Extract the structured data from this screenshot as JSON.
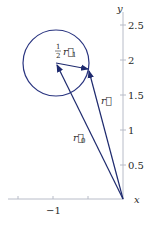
{
  "figure": {
    "colors": {
      "axis": "#b8bcc8",
      "vector": "#1e2a6e",
      "circle": "#2a3580",
      "text": "#2a2a2a"
    },
    "axes": {
      "x_label": "x",
      "y_label": "y",
      "x_ticks": [
        {
          "value": -1.5,
          "label": ""
        },
        {
          "value": -1,
          "label": "−1"
        },
        {
          "value": -0.5,
          "label": ""
        }
      ],
      "y_ticks": [
        {
          "value": 0.5,
          "label": "0.5"
        },
        {
          "value": 1,
          "label": "1"
        },
        {
          "value": 1.5,
          "label": "1.5"
        },
        {
          "value": 2,
          "label": "2"
        },
        {
          "value": 2.5,
          "label": "2.5"
        }
      ]
    },
    "circle": {
      "center": [
        -0.95,
        1.95
      ],
      "radius": 0.45
    },
    "vectors": [
      {
        "name": "r0",
        "label": "r⃗ 0",
        "from": [
          0,
          0
        ],
        "to": [
          -0.95,
          1.95
        ]
      },
      {
        "name": "r",
        "label": "r⃗",
        "from": [
          0,
          0
        ],
        "to": [
          -0.5,
          1.86
        ]
      },
      {
        "name": "half-r1",
        "label_frac": "1/2",
        "label": "r⃗ 1",
        "from": [
          -0.95,
          1.95
        ],
        "to": [
          -0.5,
          1.86
        ]
      }
    ],
    "labels": {
      "half_num": "1",
      "half_den": "2",
      "r1_text": "r⃗",
      "r1_sub": "1",
      "r_text": "r⃗",
      "r0_text": "r⃗",
      "r0_sub": "0",
      "x_axis": "x",
      "y_axis": "y",
      "y_2_5": "2.5",
      "y_2": "2",
      "y_1_5": "1.5",
      "y_1": "1",
      "y_0_5": "0.5",
      "x_m1": "−1"
    }
  }
}
